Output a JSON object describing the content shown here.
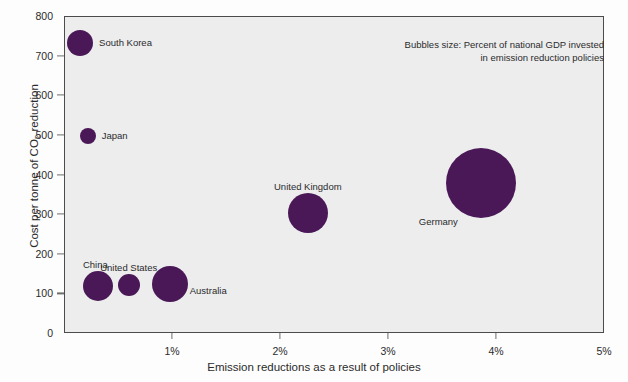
{
  "chart_data": {
    "type": "scatter",
    "title": "",
    "xlabel": "Emission reductions as a result of policies",
    "ylabel": "Cost per tonne of CO2 reduction",
    "ylabel_prefix": "Cost per tonne of CO",
    "ylabel_subscript": "2",
    "ylabel_suffix": " reduction",
    "xlim": [
      0,
      5
    ],
    "ylim": [
      0,
      800
    ],
    "grid": false,
    "legend": "none",
    "bubble_size_meaning": "Percent of national GDP invested in emission reduction policies",
    "annotation_line1": "Bubbles size: Percent of national GDP invested",
    "annotation_line2": "in emission reduction policies",
    "xticks": [
      {
        "value": 1,
        "label": "1%"
      },
      {
        "value": 2,
        "label": "2%"
      },
      {
        "value": 3,
        "label": "3%"
      },
      {
        "value": 4,
        "label": "4%"
      },
      {
        "value": 5,
        "label": "5%"
      }
    ],
    "yticks": [
      {
        "value": 0,
        "label": "0"
      },
      {
        "value": 100,
        "label": "100"
      },
      {
        "value": 200,
        "label": "200"
      },
      {
        "value": 300,
        "label": "300"
      },
      {
        "value": 400,
        "label": "400"
      },
      {
        "value": 500,
        "label": "500"
      },
      {
        "value": 600,
        "label": "600"
      },
      {
        "value": 700,
        "label": "700"
      },
      {
        "value": 800,
        "label": "800"
      }
    ],
    "bubble_color": "#4a1857",
    "plot_background": "#ededee",
    "points": [
      {
        "name": "South Korea",
        "x": 0.14,
        "y": 735,
        "r": 13,
        "label_pos": "right"
      },
      {
        "name": "Japan",
        "x": 0.21,
        "y": 500,
        "r": 8,
        "label_pos": "right"
      },
      {
        "name": "China",
        "x": 0.31,
        "y": 120,
        "r": 15,
        "label_pos": "above-left"
      },
      {
        "name": "United States",
        "x": 0.59,
        "y": 123,
        "r": 11,
        "label_pos": "above"
      },
      {
        "name": "Australia",
        "x": 0.97,
        "y": 126,
        "r": 18,
        "label_pos": "right-below"
      },
      {
        "name": "United Kingdom",
        "x": 2.25,
        "y": 305,
        "r": 20,
        "label_pos": "above"
      },
      {
        "name": "Germany",
        "x": 3.85,
        "y": 380,
        "r": 35,
        "label_pos": "below-left"
      }
    ]
  }
}
